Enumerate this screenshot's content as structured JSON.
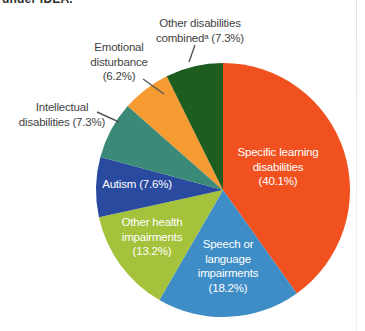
{
  "page": {
    "cropped_heading_fragment": "under IDEA.",
    "background_color": "#ffffff"
  },
  "chart_data": {
    "type": "pie",
    "title": "",
    "direction": "clockwise",
    "start_angle_deg": 0,
    "total_percent": 99.9,
    "legend": "none",
    "slices": [
      {
        "label": "Specific learning disabilities",
        "value_percent": 40.1,
        "display_lines": [
          "Specific learning",
          "disabilities",
          "(40.1%)"
        ],
        "color": "#F0511F",
        "label_placement": "inside",
        "text_color": "#FFFFFF"
      },
      {
        "label": "Speech or language impairments",
        "value_percent": 18.2,
        "display_lines": [
          "Speech or",
          "language",
          "impairments",
          "(18.2%)"
        ],
        "color": "#3E8DC6",
        "label_placement": "inside",
        "text_color": "#FFFFFF"
      },
      {
        "label": "Other health impairments",
        "value_percent": 13.2,
        "display_lines": [
          "Other health",
          "impairments",
          "(13.2%)"
        ],
        "color": "#A4C23B",
        "label_placement": "inside",
        "text_color": "#FFFFFF"
      },
      {
        "label": "Autism",
        "value_percent": 7.6,
        "display_lines": [
          "Autism (7.6%)"
        ],
        "color": "#2A4A9F",
        "label_placement": "inside",
        "text_color": "#FFFFFF"
      },
      {
        "label": "Intellectual disabilities",
        "value_percent": 7.3,
        "display_lines": [
          "Intellectual",
          "disabilities (7.3%)"
        ],
        "color": "#3B8A78",
        "label_placement": "outside",
        "text_color": "#3F3F3F"
      },
      {
        "label": "Emotional disturbance",
        "value_percent": 6.2,
        "display_lines": [
          "Emotional",
          "disturbance",
          "(6.2%)"
        ],
        "color": "#F59B32",
        "label_placement": "outside",
        "text_color": "#3F3F3F"
      },
      {
        "label": "Other disabilities combined",
        "value_percent": 7.3,
        "display_lines": [
          "Other disabilities",
          "combinedᵃ (7.3%)"
        ],
        "color": "#1F5C20",
        "label_placement": "outside",
        "text_color": "#3F3F3F"
      }
    ],
    "leader_line_color": "#55565A"
  }
}
